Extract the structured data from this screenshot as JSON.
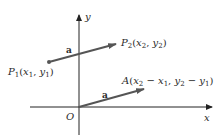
{
  "diagram": {
    "type": "vector-translation",
    "colors": {
      "axis": "#222222",
      "vector": "#555555",
      "point": "#555555",
      "text": "#2a2a2a",
      "background": "#ffffff"
    },
    "axes": {
      "x_label": "x",
      "y_label": "y",
      "origin_label": "O"
    },
    "vectors": [
      {
        "name": "a",
        "label": "a",
        "from": "P1",
        "to": "P2"
      },
      {
        "name": "a",
        "label": "a",
        "from": "O",
        "to": "A"
      }
    ],
    "points": {
      "P1": {
        "name": "P",
        "sub": "1",
        "coords_text": "(x1, y1)"
      },
      "P2": {
        "name": "P",
        "sub": "2",
        "coords_text": "(x2, y2)"
      },
      "A": {
        "name": "A",
        "coords_text": "(x2 − x1, y2 − y1)"
      }
    },
    "vector_label": "a"
  }
}
